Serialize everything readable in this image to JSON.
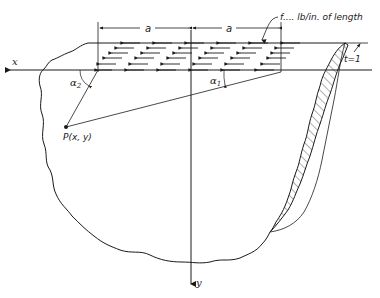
{
  "figure": {
    "type": "diagram",
    "colors": {
      "ink": "#1a1a1a",
      "background": "#ffffff"
    }
  },
  "labels": {
    "load": "f.... lb/in. of length",
    "dim_left": "a",
    "dim_right": "a",
    "thickness": "t=1",
    "x_axis": "x",
    "y_axis": "y",
    "alpha1": "α",
    "alpha1_sub": "1",
    "alpha2": "α",
    "alpha2_sub": "2",
    "point": "P(x, y)"
  },
  "elements": {
    "axes": [
      "x-axis (pointing left)",
      "y-axis (pointing down)"
    ],
    "load_region": {
      "half_width_label": "a",
      "count_half_spans": 2,
      "direction": "left"
    },
    "point_P": {
      "label": "P(x, y)"
    },
    "angles": [
      "α1",
      "α2"
    ],
    "section": "hatched cut section, thickness t=1"
  }
}
